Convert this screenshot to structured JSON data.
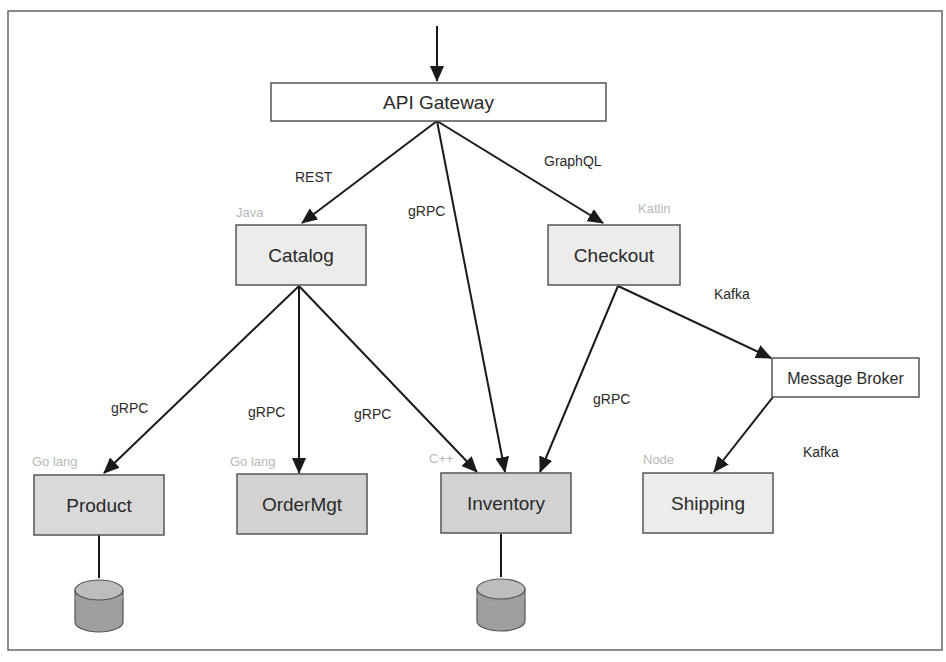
{
  "diagram": {
    "colors": {
      "frame": "#666666",
      "line": "#1a1a1a",
      "box_border": "#555555",
      "box_light": "#ececec",
      "box_dark": "#d2d2d2",
      "box_white": "#ffffff",
      "lang_label": "#b8b8b8",
      "db_top": "#bdbdbd",
      "db_body": "#9e9e9e"
    },
    "nodes": {
      "api_gateway": {
        "label": "API Gateway"
      },
      "catalog": {
        "label": "Catalog",
        "language": "Java"
      },
      "checkout": {
        "label": "Checkout",
        "language": "Katlin"
      },
      "message_broker": {
        "label": "Message Broker"
      },
      "product": {
        "label": "Product",
        "language": "Go lang"
      },
      "ordermgt": {
        "label": "OrderMgt",
        "language": "Go lang"
      },
      "inventory": {
        "label": "Inventory",
        "language": "C++"
      },
      "shipping": {
        "label": "Shipping",
        "language": "Node"
      }
    },
    "edges": [
      {
        "from": "client",
        "to": "API Gateway",
        "label": ""
      },
      {
        "from": "API Gateway",
        "to": "Catalog",
        "label": "REST"
      },
      {
        "from": "API Gateway",
        "to": "Inventory",
        "label": "gRPC"
      },
      {
        "from": "API Gateway",
        "to": "Checkout",
        "label": "GraphQL"
      },
      {
        "from": "Catalog",
        "to": "Product",
        "label": "gRPC"
      },
      {
        "from": "Catalog",
        "to": "OrderMgt",
        "label": "gRPC"
      },
      {
        "from": "Catalog",
        "to": "Inventory",
        "label": "gRPC"
      },
      {
        "from": "Checkout",
        "to": "Inventory",
        "label": "gRPC"
      },
      {
        "from": "Checkout",
        "to": "Message Broker",
        "label": "Kafka"
      },
      {
        "from": "Message Broker",
        "to": "Shipping",
        "label": "Kafka"
      }
    ],
    "databases": [
      {
        "attached_to": "Product"
      },
      {
        "attached_to": "Inventory"
      }
    ]
  }
}
